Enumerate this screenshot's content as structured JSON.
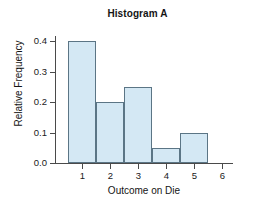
{
  "chart_data": {
    "type": "bar",
    "title": "Histogram A",
    "xlabel": "Outcome on Die",
    "ylabel": "Relative Frequency",
    "categories": [
      "1",
      "2",
      "3",
      "4",
      "5",
      "6"
    ],
    "values": [
      0.4,
      0.2,
      0.25,
      0.05,
      0.1,
      0.0
    ],
    "xtick_labels": [
      "1",
      "2",
      "3",
      "4",
      "5",
      "6"
    ],
    "ytick_labels": [
      "0.0",
      "0.1",
      "0.2",
      "0.3",
      "0.4"
    ],
    "ytick_values": [
      0.0,
      0.1,
      0.2,
      0.3,
      0.4
    ],
    "ylim": [
      0.0,
      0.42
    ],
    "xlim": [
      0.5,
      6.5
    ],
    "grid": false,
    "legend": null,
    "bar_fill_color": "#d4e8f4",
    "bar_edge_color": "#5b7585",
    "axis_color": "#4a4a4a",
    "background_color": "#ffffff",
    "bin_edges": [
      0.5,
      1.5,
      2.5,
      3.5,
      4.5,
      5.5,
      6.5
    ]
  }
}
